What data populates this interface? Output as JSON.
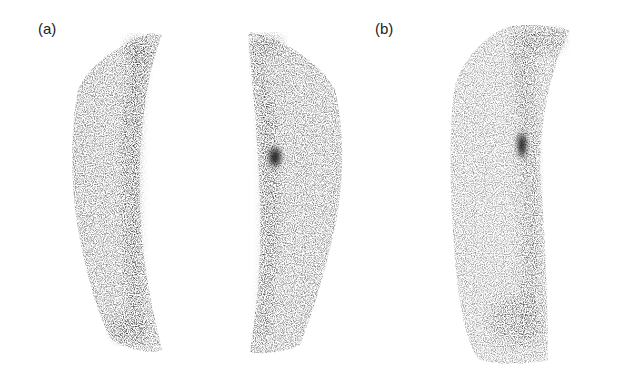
{
  "figure": {
    "panels": [
      {
        "label": "(a)",
        "description": "Bilateral anterior bone scintigraphy of lower legs; focal intense uptake in right-image tibial shaft"
      },
      {
        "label": "(b)",
        "description": "Lateral view scintigraphy of single lower leg with focal uptake in mid-upper shaft"
      }
    ],
    "colors": {
      "background": "#ffffff",
      "uptake": "#1a1a1a",
      "label": "#222222"
    }
  }
}
